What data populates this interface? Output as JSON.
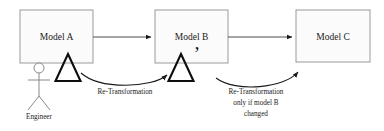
{
  "diagram": {
    "background_color": "#ffffff",
    "boxes": [
      {
        "id": "model-a",
        "label": "Model A",
        "x": 20,
        "y": 10,
        "width": 73,
        "height": 53,
        "fill": "#fbfbfb",
        "stroke": "#9a9a9a"
      },
      {
        "id": "model-b",
        "label": "Model B",
        "x": 155,
        "y": 10,
        "width": 73,
        "height": 53,
        "fill": "#fbfbfb",
        "stroke": "#9a9a9a"
      },
      {
        "id": "model-c",
        "label": "Model C",
        "x": 296,
        "y": 10,
        "width": 74,
        "height": 52,
        "fill": "#fbfbfb",
        "stroke": "#9a9a9a"
      }
    ],
    "straight_arrows": [
      {
        "id": "arrow-a-to-b",
        "from": "model-a",
        "to": "model-b",
        "x1": 93,
        "y1": 37,
        "x2": 153,
        "y2": 37
      },
      {
        "id": "arrow-b-to-c",
        "from": "model-b",
        "to": "model-c",
        "x1": 228,
        "y1": 37,
        "x2": 294,
        "y2": 37
      }
    ],
    "curved_arrows": [
      {
        "id": "retransform-b-to-a",
        "label_lines": [
          "Re-Transformation"
        ],
        "label_x": 125,
        "label_y": 92,
        "path": "M 81 73 C 100 90, 152 88, 169 74"
      },
      {
        "id": "retransform-c-to-b",
        "label_lines": [
          "Re-Transformation",
          "only if model B",
          "changed"
        ],
        "label_x": 255,
        "label_y": 92,
        "path": "M 216 77 C 236 92, 285 88, 300 71"
      }
    ],
    "delta_markers": [
      {
        "id": "delta-a",
        "glyph": "Δ",
        "prime": "",
        "x": 68,
        "y": 81
      },
      {
        "id": "delta-b",
        "glyph": "Δ",
        "prime": "’",
        "x": 181,
        "y": 81,
        "prime_x": 196,
        "prime_y": 60
      }
    ],
    "actor": {
      "id": "engineer-actor",
      "label": "Engineer",
      "label_x": 39,
      "label_y": 116,
      "head_cx": 39,
      "head_cy": 68,
      "head_r": 5,
      "body_x": 39,
      "body_y1": 73,
      "body_y2": 96,
      "arm_y": 80,
      "arm_x1": 28,
      "arm_x2": 50,
      "leg_left_x": 28,
      "leg_right_x": 50,
      "leg_y": 110,
      "stroke": "#8a8a8a"
    }
  }
}
